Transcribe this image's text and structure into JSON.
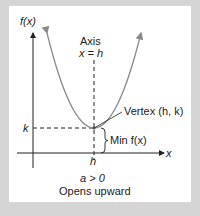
{
  "diagram": {
    "y_axis_label": "f(x)",
    "x_axis_label": "x",
    "axis_title": "Axis",
    "axis_equation": "x = h",
    "vertex_label": "Vertex (h, k)",
    "min_label": "Min f(x)",
    "k_label": "k",
    "h_label": "h",
    "condition": "a > 0",
    "caption": "Opens upward",
    "colors": {
      "background": "#d5d5d5",
      "panel": "#ffffff",
      "parabola": "#8a8a8a",
      "axes": "#222222"
    }
  }
}
